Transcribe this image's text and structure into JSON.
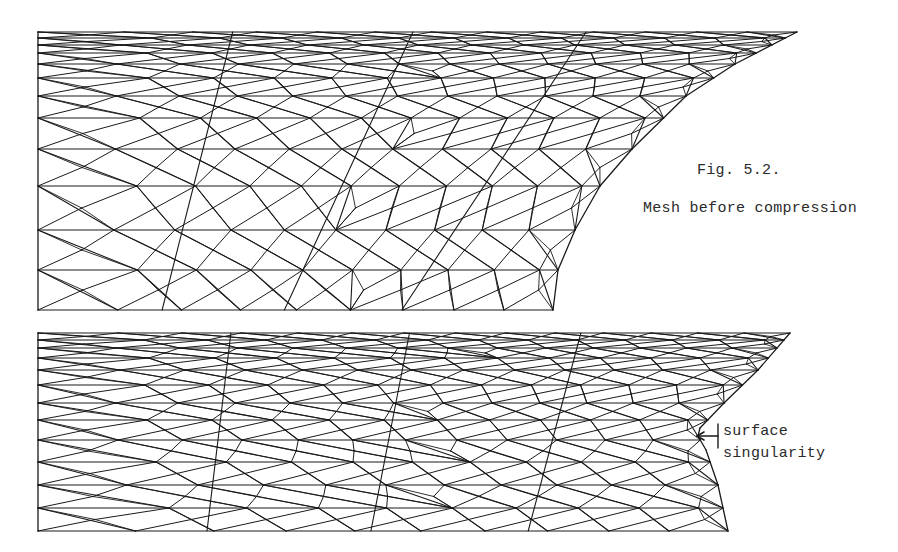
{
  "figure": {
    "number": "Fig. 5.2.",
    "title": "Mesh before compression",
    "ink_color": "#1a1a1a",
    "background": "#ffffff"
  },
  "meshes": [
    {
      "id": "before-compression",
      "description": "triangular mesh, uncompressed, concave curved right boundary",
      "left": 38,
      "top": 32,
      "bottom": 310,
      "rows": [
        32,
        38,
        45,
        53,
        64,
        78,
        96,
        118,
        149,
        186,
        230,
        270,
        310
      ],
      "right_profile": [
        [
          32,
          797
        ],
        [
          64,
          735
        ],
        [
          96,
          686
        ],
        [
          149,
          632
        ],
        [
          186,
          600
        ],
        [
          230,
          575
        ],
        [
          270,
          558
        ],
        [
          310,
          553
        ]
      ],
      "columns": 9
    },
    {
      "id": "after-compression",
      "description": "triangular mesh, compressed, with surface singularity",
      "left": 38,
      "top": 333,
      "bottom": 531,
      "rows": [
        333,
        340,
        348,
        358,
        370,
        385,
        403,
        420,
        440,
        462,
        485,
        508,
        531
      ],
      "right_profile": [
        [
          333,
          790
        ],
        [
          370,
          758
        ],
        [
          403,
          724
        ],
        [
          428,
          700
        ],
        [
          436,
          698
        ],
        [
          450,
          706
        ],
        [
          485,
          718
        ],
        [
          531,
          728
        ]
      ],
      "columns": 10
    }
  ],
  "annotation": {
    "line1": "surface",
    "line2": "singularity",
    "arrow_tip": [
      697,
      436
    ],
    "bracket_x": 718
  }
}
